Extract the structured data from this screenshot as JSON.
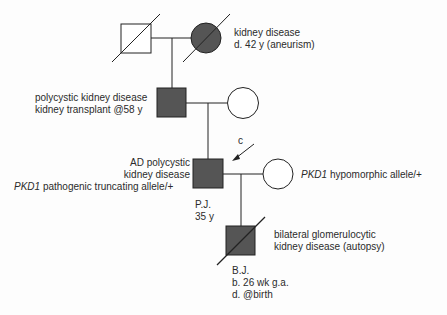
{
  "colors": {
    "affected_fill": "#555555",
    "unaffected_fill": "#ffffff",
    "line": "#222222"
  },
  "generations": [
    {
      "id": "I",
      "individuals": [
        {
          "id": "I-1",
          "sex": "male",
          "affected": false,
          "deceased": true,
          "labels": []
        },
        {
          "id": "I-2",
          "sex": "female",
          "affected": true,
          "deceased": true,
          "labels": [
            "kidney disease",
            "d. 42 y (aneurism)"
          ]
        }
      ]
    },
    {
      "id": "II",
      "individuals": [
        {
          "id": "II-1",
          "sex": "male",
          "affected": true,
          "deceased": false,
          "labels": [
            "polycystic kidney disease",
            "kidney transplant @58 y"
          ]
        },
        {
          "id": "II-2",
          "sex": "female",
          "affected": false,
          "deceased": false,
          "labels": []
        }
      ]
    },
    {
      "id": "III",
      "individuals": [
        {
          "id": "III-1",
          "sex": "male",
          "affected": true,
          "deceased": false,
          "proband": true,
          "proband_marker": "c",
          "labels": [
            "AD polycystic",
            "kidney disease"
          ],
          "genotype": {
            "gene": "PKD1",
            "text": " pathogenic truncating allele/+"
          },
          "name": "P.J.",
          "age": "35 y"
        },
        {
          "id": "III-2",
          "sex": "female",
          "affected": false,
          "deceased": false,
          "genotype": {
            "gene": "PKD1",
            "text": " hypomorphic allele/+"
          }
        }
      ]
    },
    {
      "id": "IV",
      "individuals": [
        {
          "id": "IV-1",
          "sex": "male",
          "affected": true,
          "deceased": true,
          "labels": [
            "bilateral glomerulocytic",
            "kidney disease (autopsy)"
          ],
          "name": "B.J.",
          "details": [
            "b. 26 wk g.a.",
            "d. @birth"
          ]
        }
      ]
    }
  ]
}
